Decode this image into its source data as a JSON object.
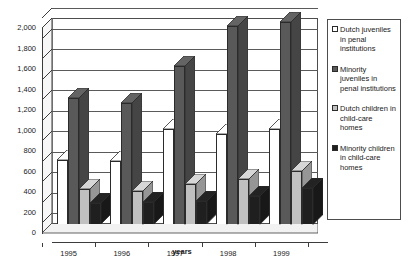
{
  "chart_data": {
    "type": "bar",
    "title": "",
    "subtitle": "",
    "xlabel": "years",
    "ylabel": "",
    "ylim": [
      0,
      2000
    ],
    "ytick_step": 200,
    "ytick_labels": [
      "2,000",
      "1,800",
      "1,600",
      "1,400",
      "1,200",
      "1,000",
      "800",
      "600",
      "400",
      "200",
      "0"
    ],
    "ytick_values": [
      2000,
      1800,
      1600,
      1400,
      1200,
      1000,
      800,
      600,
      400,
      200,
      0
    ],
    "grid": true,
    "legend_position": "right",
    "categories": [
      "1995",
      "1996",
      "1997",
      "1998",
      "1999"
    ],
    "series": [
      {
        "name": "Dutch juveniles in penal institutions",
        "color": "#ffffff",
        "values": [
          620,
          610,
          925,
          880,
          930
        ]
      },
      {
        "name": "Minority juveniles in penal institutions",
        "color": "#595959",
        "values": [
          1225,
          1180,
          1545,
          1935,
          1975
        ]
      },
      {
        "name": "Dutch children in child-care homes",
        "color": "#c0c0c0",
        "values": [
          340,
          325,
          390,
          440,
          520
        ]
      },
      {
        "name": "Minority children in child-care homes",
        "color": "#1f1f1f",
        "values": [
          205,
          215,
          220,
          275,
          355
        ]
      }
    ]
  },
  "legend": {
    "items": [
      {
        "label": "Dutch juveniles in penal institutions",
        "color": "#ffffff"
      },
      {
        "label": "Minority juveniles in penal institutions",
        "color": "#595959"
      },
      {
        "label": "Dutch children in child-care homes",
        "color": "#c0c0c0"
      },
      {
        "label": "Minority children in child-care homes",
        "color": "#1f1f1f"
      }
    ]
  },
  "colors": {
    "axis": "#3c3c3c",
    "grid": "#5a5a5a",
    "plot_background": "#ffffff",
    "floor": "#f2f2f2",
    "left_wall": "#f7f7f7",
    "bar_outline": "#2b2b2b"
  }
}
